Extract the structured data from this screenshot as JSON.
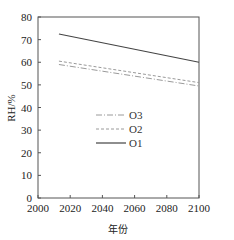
{
  "chart_data": {
    "type": "line",
    "title": "",
    "xlabel": "年份",
    "ylabel": "RH/%",
    "xlim": [
      2000,
      2100
    ],
    "ylim": [
      0,
      80
    ],
    "xticks": [
      2000,
      2020,
      2040,
      2060,
      2080,
      2100
    ],
    "yticks": [
      0,
      10,
      20,
      30,
      40,
      50,
      60,
      70,
      80
    ],
    "grid": false,
    "legend_position": "center",
    "series": [
      {
        "name": "O3",
        "style": "dash-dot",
        "color": "#9a9a9a",
        "x": [
          2013,
          2100
        ],
        "values": [
          59.0,
          49.5
        ]
      },
      {
        "name": "O2",
        "style": "dashed",
        "color": "#9a9a9a",
        "x": [
          2013,
          2100
        ],
        "values": [
          60.5,
          51.0
        ]
      },
      {
        "name": "O1",
        "style": "solid",
        "color": "#444444",
        "x": [
          2013,
          2100
        ],
        "values": [
          72.5,
          60.0
        ]
      }
    ]
  }
}
